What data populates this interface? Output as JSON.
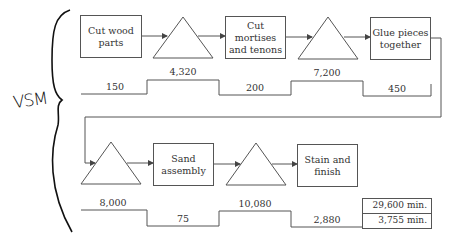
{
  "annotation": {
    "label": "VSM"
  },
  "row1": {
    "processes": [
      {
        "label_line1": "Cut wood",
        "label_line2": "parts"
      },
      {
        "label_line1": "Cut",
        "label_line2": "mortises",
        "label_line3": "and tenons"
      },
      {
        "label_line1": "Glue pieces",
        "label_line2": "together"
      }
    ],
    "timeline": {
      "process_times": [
        "150",
        "200",
        "450"
      ],
      "wait_times": [
        "4,320",
        "7,200"
      ]
    }
  },
  "row2": {
    "processes": [
      {
        "label_line1": "Sand",
        "label_line2": "assembly"
      },
      {
        "label_line1": "Stain and",
        "label_line2": "finish"
      }
    ],
    "timeline": {
      "wait_times": [
        "8,000",
        "10,080"
      ],
      "process_times": [
        "75",
        "2,880"
      ]
    }
  },
  "totals": {
    "lead_time": "29,600 min.",
    "process_time": "3,755 min."
  },
  "colors": {
    "line": "#555555",
    "text": "#333333",
    "handwriting": "#111111"
  }
}
